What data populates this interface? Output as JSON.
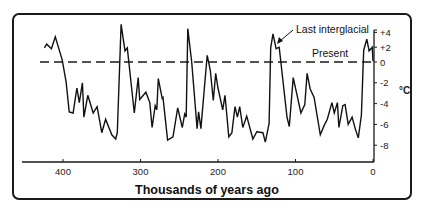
{
  "chart_data": {
    "type": "line",
    "title": "",
    "xlabel": "Thousands of years ago",
    "ylabel": "°C",
    "xlim": [
      430,
      0
    ],
    "ylim": [
      -8.5,
      5
    ],
    "x_ticks": [
      400,
      300,
      200,
      100,
      0
    ],
    "x_tick_labels": [
      "400",
      "300",
      "200",
      "100",
      "0"
    ],
    "y_ticks": [
      4,
      2,
      0,
      -2,
      -4,
      -6,
      -8
    ],
    "y_tick_labels": [
      "+4",
      "+2",
      "0",
      "-2",
      "-4",
      "-6",
      "-8"
    ],
    "y_axis_position": "right",
    "grid": false,
    "reference_line": {
      "y": 0,
      "label": "Present",
      "style": "dashed"
    },
    "annotations": [
      {
        "text": "Last interglacial",
        "points_to": {
          "x": 128,
          "y": 3.5
        }
      }
    ],
    "series": [
      {
        "name": "Temperature anomaly",
        "x": [
          424,
          421,
          415,
          410,
          401,
          396,
          392,
          387,
          382,
          379,
          375,
          373,
          368,
          361,
          356,
          350,
          345,
          337,
          332,
          330,
          325,
          320,
          317,
          308,
          303,
          301,
          293,
          288,
          285,
          281,
          279,
          277,
          272,
          271,
          265,
          258,
          252,
          246,
          243,
          241,
          239,
          234,
          227,
          225,
          222,
          214,
          210,
          206,
          203,
          200,
          194,
          191,
          186,
          182,
          178,
          175,
          172,
          168,
          163,
          155,
          150,
          142,
          139,
          134,
          132,
          129,
          125,
          121,
          111,
          108,
          103,
          98,
          93,
          88,
          85,
          81,
          76,
          68,
          63,
          59,
          53,
          50,
          46,
          44,
          39,
          36,
          32,
          27,
          23,
          19,
          15,
          12,
          8,
          5,
          1,
          0
        ],
        "y": [
          1.9,
          2.4,
          1.8,
          3.4,
          0.3,
          -1.9,
          -4.8,
          -4.9,
          -2.5,
          -3.9,
          -2.0,
          -5.3,
          -3.2,
          -4.9,
          -4.3,
          -6.8,
          -5.5,
          -7.0,
          -7.4,
          -6.8,
          5.1,
          1.5,
          1.9,
          -4.9,
          -1.5,
          -3.6,
          -2.9,
          -3.9,
          -6.3,
          -4.2,
          -4.6,
          -1.6,
          -3.5,
          -3.4,
          -7.5,
          -7.2,
          -4.4,
          -6.3,
          -5.0,
          -5.3,
          4.5,
          0.0,
          -6.4,
          -4.8,
          -6.4,
          0.9,
          -0.8,
          -3.7,
          -1.1,
          -2.5,
          -4.6,
          -3.2,
          -7.2,
          -6.8,
          -4.3,
          -5.3,
          -4.3,
          -6.3,
          -5.2,
          -7.4,
          -6.7,
          -6.8,
          -7.7,
          -5.9,
          1.9,
          3.8,
          1.8,
          2.0,
          -5.3,
          -6.2,
          -1.5,
          -3.2,
          -4.9,
          -4.1,
          -1.1,
          -2.6,
          -3.4,
          -7.0,
          -6.1,
          -5.5,
          -3.9,
          -4.9,
          -3.9,
          -6.3,
          -4.2,
          -4.1,
          -6.0,
          -5.3,
          -6.4,
          -7.3,
          -5.1,
          1.6,
          3.1,
          1.5,
          2.0,
          0.1
        ]
      }
    ]
  },
  "labels": {
    "present": "Present",
    "last_interglacial": "Last interglacial",
    "y_unit": "°C",
    "x_title": "Thousands of years ago"
  }
}
